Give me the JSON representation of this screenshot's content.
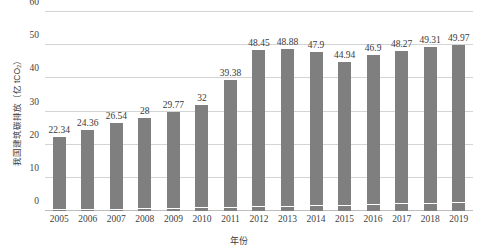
{
  "chart_data": {
    "type": "bar",
    "title": "",
    "xlabel": "年份",
    "ylabel": "我国建筑碳排放（亿 tCO₂）",
    "ylim": [
      0,
      60
    ],
    "yticks": [
      0,
      10,
      20,
      30,
      40,
      50,
      60
    ],
    "grid": true,
    "legend": "none",
    "categories": [
      "2005",
      "2006",
      "2007",
      "2008",
      "2009",
      "2010",
      "2011",
      "2012",
      "2013",
      "2014",
      "2015",
      "2016",
      "2017",
      "2018",
      "2019"
    ],
    "values": [
      22.34,
      24.36,
      26.54,
      28,
      29.77,
      32,
      39.38,
      48.45,
      48.88,
      47.9,
      44.94,
      46.9,
      48.27,
      49.31,
      49.97
    ],
    "labels": [
      "22.34",
      "24.36",
      "26.54",
      "28",
      "29.77",
      "32",
      "39.38",
      "48.45",
      "48.88",
      "47.9",
      "44.94",
      "46.9",
      "48.27",
      "49.31",
      "49.97"
    ],
    "base_segment": [
      0.25,
      0.3,
      0.45,
      0.55,
      0.7,
      0.85,
      0.95,
      1.15,
      1.3,
      1.5,
      1.65,
      1.85,
      2.0,
      2.15,
      2.3
    ],
    "bar_color": "#7f7f7f",
    "gridline_color": "#d4d4d4",
    "axis_color": "#bdbdbd",
    "text_color": "#3a3a3a",
    "background": "#ffffff"
  }
}
